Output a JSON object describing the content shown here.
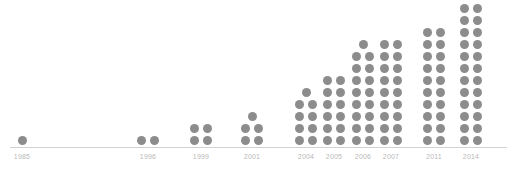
{
  "chart_data": {
    "type": "bar",
    "title": "",
    "subtitle": "",
    "xlabel": "",
    "ylabel": "",
    "grid": false,
    "legend": null,
    "unit_marker": "dot",
    "dots_per_row": 2,
    "categories": [
      "1985",
      "1996",
      "1999",
      "2001",
      "2004",
      "2005",
      "2006",
      "2007",
      "2011",
      "2014"
    ],
    "values": [
      1,
      2,
      4,
      5,
      9,
      12,
      17,
      18,
      20,
      24
    ],
    "ylim": [
      0,
      24
    ],
    "series": [
      {
        "name": "count",
        "values": [
          1,
          2,
          4,
          5,
          9,
          12,
          17,
          18,
          20,
          24
        ]
      }
    ],
    "points": [
      {
        "year": "1985",
        "count": 1,
        "x": 22
      },
      {
        "year": "1996",
        "count": 2,
        "x": 148
      },
      {
        "year": "1999",
        "count": 4,
        "x": 201
      },
      {
        "year": "2001",
        "count": 5,
        "x": 252
      },
      {
        "year": "2004",
        "count": 9,
        "x": 306
      },
      {
        "year": "2005",
        "count": 12,
        "x": 334
      },
      {
        "year": "2006",
        "count": 17,
        "x": 363
      },
      {
        "year": "2007",
        "count": 18,
        "x": 391
      },
      {
        "year": "2011",
        "count": 20,
        "x": 434
      },
      {
        "year": "2014",
        "count": 24,
        "x": 471
      }
    ],
    "colors": {
      "dot": "#8c8c8c",
      "axis": "#d2d2d2",
      "tick_label": "#b9b9b9",
      "background": "#ffffff"
    }
  }
}
